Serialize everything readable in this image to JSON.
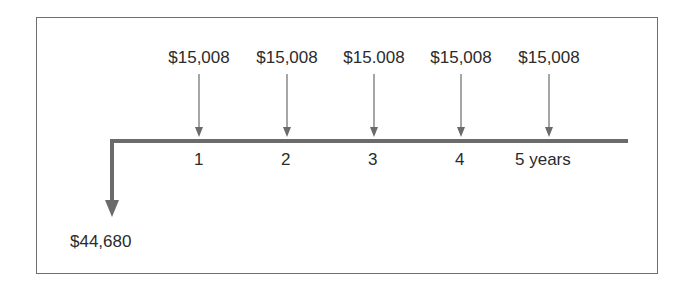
{
  "diagram": {
    "type": "cash-flow-timeline",
    "initial_outflow": {
      "label": "$44,680",
      "period": 0,
      "direction": "down"
    },
    "payments": [
      {
        "label": "$15,008",
        "period": 1
      },
      {
        "label": "$15,008",
        "period": 2
      },
      {
        "label": "$15.008",
        "period": 3
      },
      {
        "label": "$15,008",
        "period": 4
      },
      {
        "label": "$15,008",
        "period": 5
      }
    ],
    "ticks": [
      "1",
      "2",
      "3",
      "4",
      "5 years"
    ],
    "colors": {
      "line": "#6b6b6b",
      "text": "#2b2b2b",
      "frame": "#6e6e6e"
    }
  }
}
